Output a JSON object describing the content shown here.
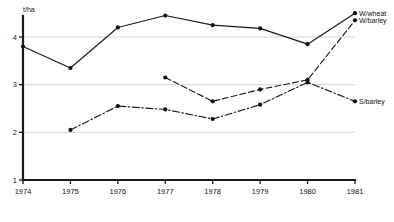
{
  "chart_data": {
    "type": "line",
    "title": "",
    "xlabel": "",
    "ylabel": "t/ha",
    "y_unit_label": "t/ha",
    "x": [
      1974,
      1975,
      1976,
      1977,
      1978,
      1979,
      1980,
      1981
    ],
    "xticklabels": [
      "1974",
      "1975",
      "1976",
      "1977",
      "1978",
      "1979",
      "1980",
      "1981"
    ],
    "yticklabels": [
      "1",
      "2",
      "3",
      "4"
    ],
    "yticks": [
      1,
      2,
      3,
      4
    ],
    "ylim": [
      1,
      4.75
    ],
    "xlim": [
      1974,
      1981
    ],
    "grid": "horizontal",
    "legend_position": "right-inline-end-of-line",
    "series": [
      {
        "name": "W/wheat",
        "label": "W/wheat",
        "linestyle": "solid",
        "color": "#1a1a1a",
        "marker": "circle",
        "x": [
          1974,
          1975,
          1976,
          1977,
          1978,
          1979,
          1980,
          1981
        ],
        "values": [
          3.8,
          3.35,
          4.2,
          4.45,
          4.25,
          4.18,
          3.85,
          4.5
        ]
      },
      {
        "name": "W/barley",
        "label": "W/barley",
        "linestyle": "dashed",
        "color": "#1a1a1a",
        "marker": "circle",
        "x": [
          1977,
          1978,
          1979,
          1980,
          1981
        ],
        "values": [
          3.15,
          2.65,
          2.9,
          3.1,
          4.35
        ]
      },
      {
        "name": "S/barley",
        "label": "S/barley",
        "linestyle": "dashdot",
        "color": "#1a1a1a",
        "marker": "circle",
        "x": [
          1975,
          1976,
          1977,
          1978,
          1979,
          1980,
          1981
        ],
        "values": [
          2.05,
          2.55,
          2.48,
          2.28,
          2.58,
          3.05,
          2.65
        ]
      }
    ]
  }
}
